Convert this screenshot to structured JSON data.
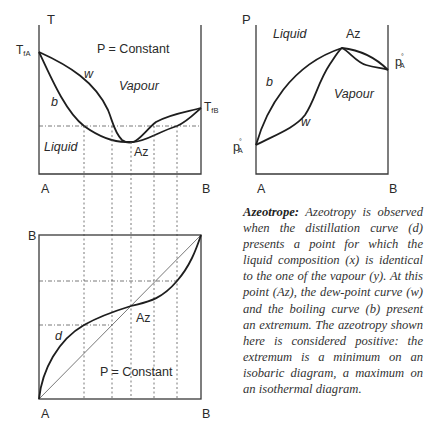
{
  "tx_diagram": {
    "axis_y_label": "T",
    "condition": "P = Constant",
    "tfa_label_main": "T",
    "tfa_label_sub": "fA",
    "tfb_label_main": "T",
    "tfb_label_sub": "fB",
    "curve_w_label": "w",
    "curve_b_label": "b",
    "region_vapour": "Vapour",
    "region_liquid": "Liquid",
    "azeotrope_label": "Az",
    "x_left_label": "A",
    "x_right_label": "B"
  },
  "px_diagram": {
    "axis_y_label": "P",
    "region_liquid": "Liquid",
    "region_vapour": "Vapour",
    "azeotrope_label": "Az",
    "curve_b_label": "b",
    "curve_w_label": "w",
    "left_pressure_main": "p",
    "left_pressure_sup": "°",
    "left_pressure_sub": "A",
    "right_pressure_main": "p",
    "right_pressure_sup": "°",
    "right_pressure_sub": "A",
    "x_left_label": "A",
    "x_right_label": "B"
  },
  "yx_diagram": {
    "y_top_label": "B",
    "curve_d_label": "d",
    "azeotrope_label": "Az",
    "condition": "P = Constant",
    "x_left_label": "A",
    "x_right_label": "B"
  },
  "caption": {
    "title": "Azeotrope:",
    "body": "Azeotropy is observed when the distillation curve (d) presents a point for which the liquid composition (x) is identical to the one of the vapour (y). At this point (Az), the dew-point curve (w) and the boiling curve (b) present an extremum. The azeotropy shown here is considered positive: the extremum is a minimum on an isobaric diagram, a maximum on an isothermal diagram."
  },
  "colors": {
    "curve": "#1e1e1e",
    "frame": "#3a3a3a",
    "guide": "#555555"
  }
}
